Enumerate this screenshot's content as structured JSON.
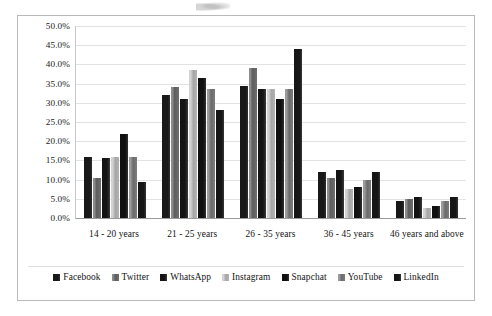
{
  "chart_data": {
    "type": "bar",
    "title": "",
    "subtitle": "",
    "xlabel": "",
    "ylabel": "",
    "grid": true,
    "legend_position": "bottom",
    "ylim": [
      0,
      50
    ],
    "ytick_format": "percent",
    "yticks": [
      "0.0%",
      "5.0%",
      "10.0%",
      "15.0%",
      "20.0%",
      "25.0%",
      "30.0%",
      "35.0%",
      "40.0%",
      "45.0%",
      "50.0%"
    ],
    "ytick_values": [
      0,
      5,
      10,
      15,
      20,
      25,
      30,
      35,
      40,
      45,
      50
    ],
    "categories": [
      "14 - 20 years",
      "21 - 25 years",
      "26 - 35 years",
      "36 - 45 years",
      "46 years and above"
    ],
    "series": [
      {
        "name": "Facebook",
        "shade": "s0",
        "values": [
          16.0,
          32.0,
          34.5,
          12.0,
          4.5
        ]
      },
      {
        "name": "Twitter",
        "shade": "s1",
        "values": [
          10.5,
          34.0,
          39.0,
          10.5,
          5.0
        ]
      },
      {
        "name": "WhatsApp",
        "shade": "s2",
        "values": [
          15.5,
          31.0,
          33.5,
          12.5,
          5.5
        ]
      },
      {
        "name": "Instagram",
        "shade": "s3",
        "values": [
          16.0,
          38.5,
          33.5,
          7.5,
          2.5
        ]
      },
      {
        "name": "Snapchat",
        "shade": "s4",
        "values": [
          22.0,
          36.5,
          31.0,
          8.0,
          3.0
        ]
      },
      {
        "name": "YouTube",
        "shade": "s5",
        "values": [
          16.0,
          33.5,
          33.5,
          10.0,
          4.5
        ]
      },
      {
        "name": "LinkedIn",
        "shade": "s6",
        "values": [
          9.5,
          28.0,
          44.0,
          12.0,
          5.5
        ]
      }
    ]
  }
}
